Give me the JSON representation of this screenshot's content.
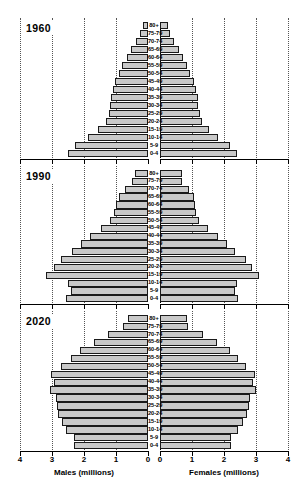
{
  "figure": {
    "age_groups": [
      "0-4",
      "5-9",
      "10-14",
      "15-19",
      "20-24",
      "25-29",
      "30-34",
      "35-39",
      "40-44",
      "45-49",
      "50-54",
      "55-59",
      "60-64",
      "65-69",
      "70-74",
      "75-79",
      "80+"
    ],
    "left_axis_title": "Males (millions)",
    "right_axis_title": "Females (millions)",
    "left_ticks": [
      "4",
      "3",
      "2",
      "1",
      "0"
    ],
    "right_ticks": [
      "0",
      "1",
      "2",
      "3",
      "4"
    ],
    "axis_max": 4,
    "colors": {
      "bar_fill": "#c9c9c9",
      "bar_stroke": "#1a1a1a",
      "grid": "#555555",
      "axis": "#000000",
      "background": "#ffffff"
    }
  },
  "chart_data": {
    "type": "bar",
    "title": "",
    "subtype": "population-pyramid",
    "xlabel": "Population (millions)",
    "ylabel": "Age group",
    "xlim": [
      0,
      4
    ],
    "grid": true,
    "legend": "none",
    "categories": [
      "0-4",
      "5-9",
      "10-14",
      "15-19",
      "20-24",
      "25-29",
      "30-34",
      "35-39",
      "40-44",
      "45-49",
      "50-54",
      "55-59",
      "60-64",
      "65-69",
      "70-74",
      "75-79",
      "80+"
    ],
    "panels": [
      {
        "label": "1960",
        "series": [
          {
            "name": "Males (millions)",
            "side": "left",
            "values": [
              2.5,
              2.28,
              1.88,
              1.55,
              1.3,
              1.22,
              1.18,
              1.15,
              1.1,
              1.02,
              0.92,
              0.8,
              0.67,
              0.52,
              0.38,
              0.24,
              0.17
            ]
          },
          {
            "name": "Females (millions)",
            "side": "right",
            "values": [
              2.42,
              2.2,
              1.82,
              1.52,
              1.32,
              1.25,
              1.2,
              1.18,
              1.12,
              1.05,
              0.95,
              0.84,
              0.72,
              0.58,
              0.45,
              0.3,
              0.25
            ]
          }
        ]
      },
      {
        "label": "1990",
        "series": [
          {
            "name": "Males (millions)",
            "side": "left",
            "values": [
              2.55,
              2.42,
              2.5,
              3.2,
              2.95,
              2.72,
              2.38,
              2.1,
              1.8,
              1.48,
              1.18,
              1.05,
              1.0,
              0.92,
              0.72,
              0.5,
              0.4
            ]
          },
          {
            "name": "Females (millions)",
            "side": "right",
            "values": [
              2.45,
              2.35,
              2.42,
              3.1,
              2.88,
              2.68,
              2.35,
              2.08,
              1.8,
              1.5,
              1.22,
              1.12,
              1.1,
              1.05,
              0.9,
              0.68,
              0.7
            ]
          }
        ]
      },
      {
        "label": "2020",
        "series": [
          {
            "name": "Males (millions)",
            "side": "left",
            "values": [
              2.3,
              2.3,
              2.55,
              2.7,
              2.82,
              2.85,
              2.88,
              3.05,
              2.95,
              3.02,
              2.72,
              2.42,
              2.12,
              1.7,
              1.25,
              0.78,
              0.62
            ]
          },
          {
            "name": "Females (millions)",
            "side": "right",
            "values": [
              2.22,
              2.22,
              2.45,
              2.6,
              2.72,
              2.78,
              2.82,
              3.0,
              2.9,
              2.98,
              2.7,
              2.45,
              2.18,
              1.78,
              1.35,
              0.88,
              0.85
            ]
          }
        ]
      }
    ]
  }
}
